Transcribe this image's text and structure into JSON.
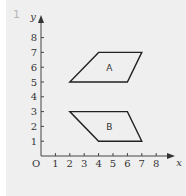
{
  "question_number": "1",
  "axes": {
    "x_label": "x",
    "y_label": "y",
    "origin_label": "O",
    "x_ticks": [
      "1",
      "2",
      "3",
      "4",
      "5",
      "6",
      "7",
      "8"
    ],
    "y_ticks": [
      "1",
      "2",
      "3",
      "4",
      "5",
      "6",
      "7",
      "8"
    ]
  },
  "shapes": [
    {
      "label": "A",
      "vertices": [
        [
          2,
          5
        ],
        [
          6,
          5
        ],
        [
          7,
          7
        ],
        [
          4,
          7
        ]
      ]
    },
    {
      "label": "B",
      "vertices": [
        [
          2,
          3
        ],
        [
          6,
          3
        ],
        [
          7,
          1
        ],
        [
          4,
          1
        ]
      ]
    }
  ],
  "chart_data": {
    "type": "diagram",
    "title": "",
    "xlabel": "x",
    "ylabel": "y",
    "xlim": [
      0,
      8
    ],
    "ylim": [
      0,
      8
    ],
    "grid": false,
    "shapes": [
      {
        "name": "A",
        "type": "parallelogram",
        "points": [
          [
            2,
            5
          ],
          [
            6,
            5
          ],
          [
            7,
            7
          ],
          [
            4,
            7
          ]
        ]
      },
      {
        "name": "B",
        "type": "parallelogram",
        "points": [
          [
            2,
            3
          ],
          [
            6,
            3
          ],
          [
            7,
            1
          ],
          [
            4,
            1
          ]
        ]
      }
    ]
  }
}
